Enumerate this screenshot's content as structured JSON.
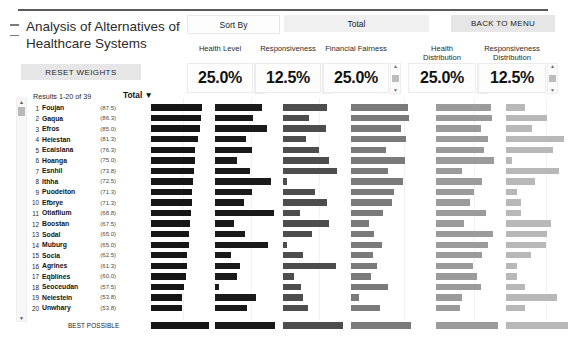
{
  "window": {
    "title_line1": "Analysis of Alternatives of",
    "title_line2": "Healthcare Systems"
  },
  "toolbar": {
    "collapse_icon": "collapse-icon",
    "reset_weights_label": "RESET WEIGHTS",
    "sort_by_label": "Sort By",
    "sort_by_value": "Total",
    "back_to_menu_label": "BACK TO MENU"
  },
  "criteria": [
    {
      "label": "Health Level",
      "label2": "",
      "value": "25.0%",
      "color": "#1a1a1a"
    },
    {
      "label": "Responsiveness",
      "label2": "",
      "value": "12.5%",
      "color": "#4d4d4d"
    },
    {
      "label": "Financial Fairness",
      "label2": "",
      "value": "25.0%",
      "color": "#7a7a7a"
    },
    {
      "label": "Health",
      "label2": "Distribution",
      "value": "25.0%",
      "color": "#9b9b9b"
    },
    {
      "label": "Responsiveness",
      "label2": "Distribution",
      "value": "12.5%",
      "color": "#b8b8b8"
    }
  ],
  "results": {
    "count_label": "Results 1-20 of 39",
    "total_column_label": "Total ▼",
    "best_possible_label": "BEST POSSIBLE"
  },
  "chart_data": {
    "type": "bar",
    "title": "Analysis of Alternatives of Healthcare Systems",
    "xlabel": "",
    "ylabel": "",
    "orientation": "horizontal",
    "sorted_by": "Total",
    "series": [
      {
        "name": "Total",
        "color": "#161616"
      },
      {
        "name": "Health Level",
        "color": "#1a1a1a"
      },
      {
        "name": "Responsiveness",
        "color": "#4d4d4d"
      },
      {
        "name": "Financial Fairness",
        "color": "#7a7a7a"
      },
      {
        "name": "Health Distribution",
        "color": "#9b9b9b"
      },
      {
        "name": "Responsiveness Distribution",
        "color": "#b8b8b8"
      }
    ],
    "categories": [
      "Foujan",
      "Gaqua",
      "Efros",
      "Heiestan",
      "Ecaislana",
      "Hoanga",
      "Esnhil",
      "Ithha",
      "Puodeiton",
      "Efbrye",
      "Otiaflium",
      "Boostan",
      "Sodal",
      "Muburg",
      "Socia",
      "Agrines",
      "Eqblines",
      "Seoceudan",
      "Neiestein",
      "Unwhary"
    ],
    "rows": [
      {
        "rank": 1,
        "name": "Foujan",
        "total": 87.5,
        "health_level": 78,
        "responsiveness": 74,
        "financial_fairness": 95,
        "health_distribution": 88,
        "responsiveness_distribution": 30
      },
      {
        "rank": 2,
        "name": "Gaqua",
        "total": 86.3,
        "health_level": 64,
        "responsiveness": 43,
        "financial_fairness": 97,
        "health_distribution": 90,
        "responsiveness_distribution": 66
      },
      {
        "rank": 3,
        "name": "Efros",
        "total": 85.0,
        "health_level": 86,
        "responsiveness": 72,
        "financial_fairness": 83,
        "health_distribution": 72,
        "responsiveness_distribution": 42
      },
      {
        "rank": 4,
        "name": "Heiestan",
        "total": 81.3,
        "health_level": 52,
        "responsiveness": 39,
        "financial_fairness": 92,
        "health_distribution": 84,
        "responsiveness_distribution": 94
      },
      {
        "rank": 5,
        "name": "Ecaislana",
        "total": 76.3,
        "health_level": 62,
        "responsiveness": 60,
        "financial_fairness": 58,
        "health_distribution": 78,
        "responsiveness_distribution": 76
      },
      {
        "rank": 6,
        "name": "Hoanga",
        "total": 75.0,
        "health_level": 36,
        "responsiveness": 76,
        "financial_fairness": 90,
        "health_distribution": 93,
        "responsiveness_distribution": 10
      },
      {
        "rank": 7,
        "name": "Esnhil",
        "total": 73.8,
        "health_level": 58,
        "responsiveness": 90,
        "financial_fairness": 62,
        "health_distribution": 42,
        "responsiveness_distribution": 86
      },
      {
        "rank": 8,
        "name": "Ithha",
        "total": 72.5,
        "health_level": 94,
        "responsiveness": 6,
        "financial_fairness": 86,
        "health_distribution": 74,
        "responsiveness_distribution": 46
      },
      {
        "rank": 9,
        "name": "Puodeiton",
        "total": 71.3,
        "health_level": 62,
        "responsiveness": 54,
        "financial_fairness": 72,
        "health_distribution": 62,
        "responsiveness_distribution": 18
      },
      {
        "rank": 10,
        "name": "Efbrye",
        "total": 71.3,
        "health_level": 48,
        "responsiveness": 74,
        "financial_fairness": 69,
        "health_distribution": 55,
        "responsiveness_distribution": 24
      },
      {
        "rank": 11,
        "name": "Otiaflium",
        "total": 68.8,
        "health_level": 98,
        "responsiveness": 28,
        "financial_fairness": 53,
        "health_distribution": 80,
        "responsiveness_distribution": 24
      },
      {
        "rank": 12,
        "name": "Boostan",
        "total": 67.5,
        "health_level": 32,
        "responsiveness": 76,
        "financial_fairness": 30,
        "health_distribution": 45,
        "responsiveness_distribution": 72
      },
      {
        "rank": 13,
        "name": "Sodal",
        "total": 65.0,
        "health_level": 50,
        "responsiveness": 48,
        "financial_fairness": 38,
        "health_distribution": 92,
        "responsiveness_distribution": 66
      },
      {
        "rank": 14,
        "name": "Muburg",
        "total": 65.0,
        "health_level": 88,
        "responsiveness": 7,
        "financial_fairness": 52,
        "health_distribution": 84,
        "responsiveness_distribution": 64
      },
      {
        "rank": 15,
        "name": "Socia",
        "total": 62.5,
        "health_level": 26,
        "responsiveness": 34,
        "financial_fairness": 36,
        "health_distribution": 74,
        "responsiveness_distribution": 40
      },
      {
        "rank": 16,
        "name": "Agrines",
        "total": 61.3,
        "health_level": 42,
        "responsiveness": 88,
        "financial_fairness": 44,
        "health_distribution": 60,
        "responsiveness_distribution": 18
      },
      {
        "rank": 17,
        "name": "Eqblines",
        "total": 60.0,
        "health_level": 36,
        "responsiveness": 18,
        "financial_fairness": 34,
        "health_distribution": 66,
        "responsiveness_distribution": 18
      },
      {
        "rank": 18,
        "name": "Seoceudan",
        "total": 57.5,
        "health_level": 6,
        "responsiveness": 30,
        "financial_fairness": 62,
        "health_distribution": 72,
        "responsiveness_distribution": 30
      },
      {
        "rank": 19,
        "name": "Neiestein",
        "total": 53.8,
        "health_level": 68,
        "responsiveness": 34,
        "financial_fairness": 14,
        "health_distribution": 42,
        "responsiveness_distribution": 82
      },
      {
        "rank": 20,
        "name": "Unwhary",
        "total": 53.8,
        "health_level": 54,
        "responsiveness": 42,
        "financial_fairness": 48,
        "health_distribution": 38,
        "responsiveness_distribution": 30
      }
    ],
    "best_possible": {
      "total": 100,
      "health_level": 100,
      "responsiveness": 100,
      "financial_fairness": 100,
      "health_distribution": 100,
      "responsiveness_distribution": 100
    },
    "axis_max": 100,
    "grid": false,
    "legend": "none"
  }
}
